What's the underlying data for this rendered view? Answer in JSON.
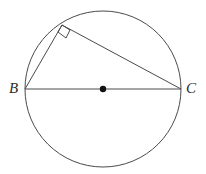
{
  "figure": {
    "width": 206,
    "height": 174,
    "background": "#ffffff",
    "stroke_color": "#4a4a4a",
    "stroke_width": 1,
    "point_color": "#111111",
    "label_color": "#2b2b2b"
  },
  "labels": {
    "b": "B",
    "c": "C"
  },
  "geometry": {
    "circle": {
      "cx": 103,
      "cy": 89,
      "r": 78
    },
    "center_point": {
      "cx": 103,
      "cy": 89,
      "size": 4
    },
    "points": {
      "b": {
        "x": 25,
        "y": 89
      },
      "c": {
        "x": 181,
        "y": 89
      },
      "a": {
        "x": 62,
        "y": 25
      }
    },
    "segments": [
      {
        "name": "diameter-bc",
        "x1": 25,
        "y1": 89,
        "x2": 181,
        "y2": 89
      },
      {
        "name": "chord-ba",
        "x1": 25,
        "y1": 89,
        "x2": 62,
        "y2": 25
      },
      {
        "name": "chord-ac",
        "x1": 62,
        "y1": 25,
        "x2": 181,
        "y2": 89
      }
    ],
    "right_angle_marker": {
      "vertex": "a",
      "points": "62,25 70,30 66,38 58,32"
    }
  },
  "chart_data": {
    "type": "diagram",
    "elements": [
      {
        "kind": "circle",
        "label": "",
        "cx": 103,
        "cy": 89,
        "r": 78
      },
      {
        "kind": "point",
        "label": "center",
        "x": 103,
        "y": 89
      },
      {
        "kind": "point",
        "label": "B",
        "x": 25,
        "y": 89
      },
      {
        "kind": "point",
        "label": "C",
        "x": 181,
        "y": 89
      },
      {
        "kind": "point",
        "label": "",
        "x": 62,
        "y": 25
      },
      {
        "kind": "segment",
        "label": "BC",
        "from": "B",
        "to": "C"
      },
      {
        "kind": "segment",
        "label": "BA",
        "from": "B",
        "to": "apex"
      },
      {
        "kind": "segment",
        "label": "AC",
        "from": "apex",
        "to": "C"
      },
      {
        "kind": "angle-marker",
        "label": "90",
        "at": "apex"
      }
    ]
  }
}
